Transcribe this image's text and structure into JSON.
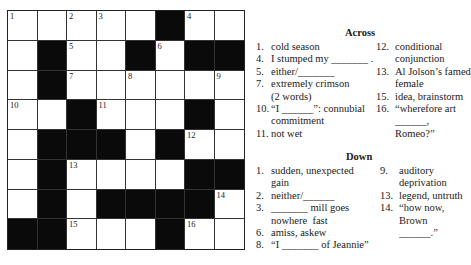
{
  "puzzle": {
    "grid": [
      [
        {
          "n": "1"
        },
        {
          "n": ""
        },
        {
          "n": "2"
        },
        {
          "n": "3"
        },
        {
          "n": ""
        },
        {
          "b": true
        },
        {
          "n": "4"
        },
        {
          "n": ""
        }
      ],
      [
        {
          "n": ""
        },
        {
          "b": true
        },
        {
          "n": "5"
        },
        {
          "n": ""
        },
        {
          "b": true
        },
        {
          "n": "6"
        },
        {
          "b": true
        },
        {
          "b": true
        }
      ],
      [
        {
          "n": ""
        },
        {
          "b": true
        },
        {
          "n": "7"
        },
        {
          "n": ""
        },
        {
          "n": "8"
        },
        {
          "n": ""
        },
        {
          "n": ""
        },
        {
          "n": "9"
        }
      ],
      [
        {
          "n": "10"
        },
        {
          "n": ""
        },
        {
          "b": true
        },
        {
          "n": "11"
        },
        {
          "n": ""
        },
        {
          "n": ""
        },
        {
          "b": true
        },
        {
          "n": ""
        }
      ],
      [
        {
          "n": ""
        },
        {
          "b": true
        },
        {
          "b": true
        },
        {
          "b": true
        },
        {
          "n": ""
        },
        {
          "b": true
        },
        {
          "n": "12"
        },
        {
          "n": ""
        }
      ],
      [
        {
          "n": ""
        },
        {
          "b": true
        },
        {
          "n": "13"
        },
        {
          "n": ""
        },
        {
          "n": ""
        },
        {
          "n": ""
        },
        {
          "b": true
        },
        {
          "b": true
        }
      ],
      [
        {
          "n": ""
        },
        {
          "b": true
        },
        {
          "n": ""
        },
        {
          "b": true
        },
        {
          "b": true
        },
        {
          "b": true
        },
        {
          "b": true
        },
        {
          "n": "14"
        }
      ],
      [
        {
          "b": true
        },
        {
          "b": true
        },
        {
          "n": "15"
        },
        {
          "n": ""
        },
        {
          "n": ""
        },
        {
          "b": true
        },
        {
          "n": "16"
        },
        {
          "n": ""
        }
      ]
    ]
  },
  "across": {
    "heading": "Across",
    "left": [
      {
        "n": "1.",
        "t": "cold season"
      },
      {
        "n": "4.",
        "t": "I stumped my _______ ."
      },
      {
        "n": "5.",
        "t": "either/_______"
      },
      {
        "n": "7.",
        "t": "extremely crimson\n(2 words)"
      },
      {
        "n": "10.",
        "t": "“I ______”: connubial\ncommitment"
      },
      {
        "n": "11.",
        "t": "not wet"
      }
    ],
    "right": [
      {
        "n": "12.",
        "t": "conditional\nconjunction"
      },
      {
        "n": "13.",
        "t": "Al Jolson’s famed\nfemale"
      },
      {
        "n": "15.",
        "t": "idea, brainstorm"
      },
      {
        "n": "16.",
        "t": "“wherefore art\n______, Romeo?”"
      }
    ]
  },
  "down": {
    "heading": "Down",
    "left": [
      {
        "n": "1.",
        "t": "sudden, unexpected\ngain"
      },
      {
        "n": "2.",
        "t": "neither/______"
      },
      {
        "n": "3.",
        "t": "_______ mill goes\nnowhere  fast"
      },
      {
        "n": "6.",
        "t": "amiss, askew"
      },
      {
        "n": "8.",
        "t": "“I _______ of Jeannie”"
      }
    ],
    "right": [
      {
        "n": "9.",
        "t": "auditory\ndeprivation"
      },
      {
        "n": "13.",
        "t": "legend, untruth"
      },
      {
        "n": "14.",
        "t": "“how now, Brown\n______.”"
      }
    ]
  }
}
